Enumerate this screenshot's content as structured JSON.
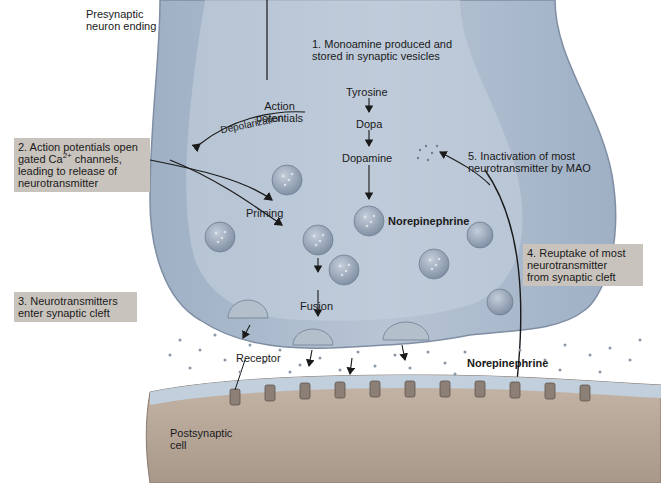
{
  "colors": {
    "neuron_fill": "#a9b7c9",
    "neuron_dark": "#8496ad",
    "cleft": "#ffffff",
    "vesicle": "#9aa7b8",
    "postsynaptic_fill": "#b9aa9c",
    "postsynaptic_membrane": "#c2d3e3",
    "receptor": "#8a7a6e",
    "label_box": "#c9c3bd",
    "arrow": "#1a1a1a",
    "text": "#1a1a1a"
  },
  "labels": {
    "presynaptic": "Presynaptic\nneuron ending",
    "action_potentials": "Action\npotentials",
    "depolarization": "Depolarization",
    "ca": "Ca",
    "ca_sup": "2+",
    "priming": "Priming",
    "fusion": "Fusion",
    "receptor": "Receptor",
    "postsynaptic": "Postsynaptic\ncell",
    "norepinephrine_vesicle": "Norepinephrine",
    "norepinephrine_cleft": "Norepinephrine"
  },
  "synthesis_pathway": [
    "Tyrosine",
    "Dopa",
    "Dopamine",
    "Norepinephrine"
  ],
  "steps": [
    {
      "number": 1,
      "text": "1. Monoamine produced and\nstored in synaptic vesicles"
    },
    {
      "number": 2,
      "text_a": "2. Action potentials open\ngated Ca",
      "sup": "2+",
      "text_b": " channels,\nleading to release of\nneurotransmitter"
    },
    {
      "number": 3,
      "text": "3. Neurotransmitters\nenter synaptic cleft"
    },
    {
      "number": 4,
      "text": "4. Reuptake of most\nneurotransmitter\nfrom synaptic cleft"
    },
    {
      "number": 5,
      "text": "5. Inactivation of most\nneurotransmitter by MAO"
    }
  ]
}
